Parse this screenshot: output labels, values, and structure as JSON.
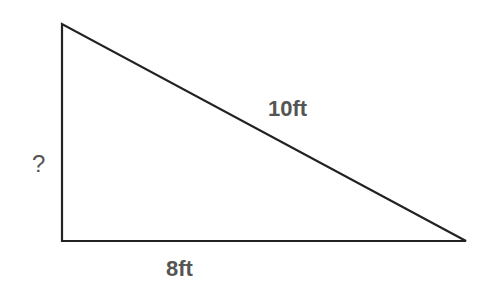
{
  "diagram": {
    "type": "right-triangle",
    "labels": {
      "hypotenuse": "10ft",
      "base": "8ft",
      "height": "?"
    },
    "vertices": {
      "top": [
        62,
        24
      ],
      "right_angle": [
        62,
        241
      ],
      "right": [
        466,
        241
      ]
    },
    "colors": {
      "stroke": "#222222",
      "label": "#555555",
      "background": "#ffffff"
    }
  }
}
